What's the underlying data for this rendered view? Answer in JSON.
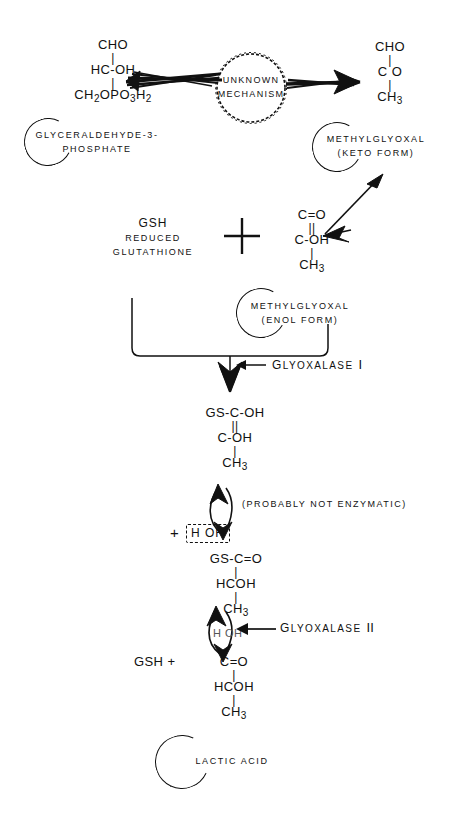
{
  "diagram": {
    "title": "Glyoxalase pathway: glyceraldehyde-3-phosphate to lactic acid",
    "ink_color": "#111111",
    "background_color": "#ffffff"
  },
  "substrates": {
    "g3p": {
      "formula_line1": "CHO",
      "formula_line2": "HC-OH",
      "formula_line3_main": "CH",
      "formula_line3_sub1": "2",
      "formula_line3_mid": "OPO",
      "formula_line3_sub2": "3",
      "formula_line3_end": "H",
      "formula_line3_sub3": "2",
      "bond1": "|",
      "bond2": "|",
      "label_line1": "GLYCERALDEHYDE-3-",
      "label_line2": "PHOSPHATE"
    },
    "methylglyoxal_keto": {
      "formula_line1": "CHO",
      "formula_line2": "C  O",
      "formula_line3_main": "CH",
      "formula_line3_sub": "3",
      "bond1": "|",
      "bond2": "|",
      "label_line1": "METHYLGLYOXAL",
      "label_line2": "(KETO FORM)"
    },
    "methylglyoxal_enol": {
      "formula_line1": "C=O",
      "formula_line2": "C-OH",
      "formula_line3_main": "CH",
      "formula_line3_sub": "3",
      "bond1": "||",
      "bond2": "|",
      "label_line1": "METHYLGLYOXAL",
      "label_line2": "(ENOL FORM)"
    },
    "glutathione": {
      "abbrev": "GSH",
      "label_line1": "REDUCED",
      "label_line2": "GLUTATHIONE"
    },
    "thiohemiacetal": {
      "formula_line1": "GS-C-OH",
      "formula_line2": "C-OH",
      "formula_line3_main": "CH",
      "formula_line3_sub": "3",
      "bond1": "||",
      "bond2": "|"
    },
    "thioester": {
      "formula_line1": "GS-C=O",
      "formula_line2": "HCOH",
      "formula_line3_main": "CH",
      "formula_line3_sub": "3",
      "bond1": "|",
      "bond2": "|"
    },
    "lactic_acid": {
      "leading": "GSH  +",
      "formula_line1": "C=O",
      "formula_line2": "HCOH",
      "formula_line3_main": "CH",
      "formula_line3_sub": "3",
      "bond1": "|",
      "bond2": "|",
      "label": "LACTIC ACID"
    }
  },
  "mechanism_circle": {
    "line1": "UNKNOWN",
    "line2": "MECHANISM"
  },
  "enzymes": {
    "glyoxalase_1": {
      "name_first": "G",
      "name_rest": "LYOXALASE",
      "numeral": "I"
    },
    "glyoxalase_2": {
      "name_first": "G",
      "name_rest": "LYOXALASE",
      "numeral": "II"
    }
  },
  "annotations": {
    "probably_not_enzymatic": "(PROBABLY NOT ENZYMATIC)",
    "water_box": "H  OH",
    "water_plus": "+",
    "water_in_glyoxalase2": "H OH",
    "reactant_plus": "+"
  }
}
